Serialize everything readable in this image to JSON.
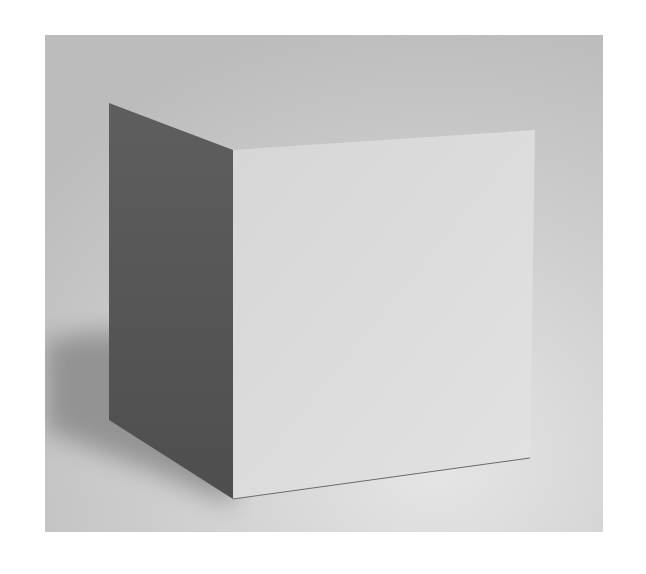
{
  "image": {
    "subject": "plaster cube still life",
    "description": "Grayscale photograph of a white cube on a plain background, lit from the right; the left face is in deep shadow and a cast shadow falls to the lower left.",
    "colors": {
      "background_light": "#e2e2e2",
      "background_mid": "#c8c8c8",
      "front_face": "#dcdcdc",
      "shadow_face": "#5a5a5a",
      "cast_shadow": "#8a8a8a"
    }
  }
}
